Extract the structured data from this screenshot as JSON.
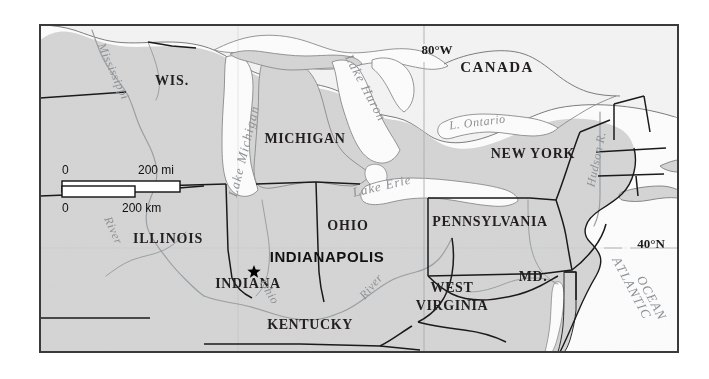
{
  "map": {
    "title": "Reference map of the Great Lakes region showing Indianapolis, Indiana",
    "frame": {
      "x": 40,
      "y": 25,
      "width": 638,
      "height": 327
    },
    "colors": {
      "land_us": "#d4d4d4",
      "land_canada": "#f2f2f2",
      "water": "#fbfbfb",
      "frame_border": "#3a3a3a",
      "state_border": "#1a1a1a",
      "river": "#9aa0a4",
      "water_label": "#8d9094",
      "page_background": "#ffffff",
      "marker": "#000000"
    },
    "labels": {
      "countries": [
        {
          "name": "CANADA",
          "text": "CANADA",
          "x": 497,
          "y": 72,
          "size": 15,
          "spacing": 1.4
        }
      ],
      "states": [
        {
          "name": "wisconsin",
          "text": "WIS.",
          "x": 172,
          "y": 85,
          "size": 14,
          "spacing": 0.8
        },
        {
          "name": "michigan",
          "text": "MICHIGAN",
          "x": 305,
          "y": 143,
          "size": 14,
          "spacing": 0.6
        },
        {
          "name": "new-york",
          "text": "NEW YORK",
          "x": 533,
          "y": 158,
          "size": 14,
          "spacing": 0.8
        },
        {
          "name": "illinois",
          "text": "ILLINOIS",
          "x": 168,
          "y": 243,
          "size": 14,
          "spacing": 0.8
        },
        {
          "name": "ohio",
          "text": "OHIO",
          "x": 348,
          "y": 230,
          "size": 14,
          "spacing": 0.8
        },
        {
          "name": "pennsylvania",
          "text": "PENNSYLVANIA",
          "x": 490,
          "y": 226,
          "size": 14,
          "spacing": 0.6
        },
        {
          "name": "indiana",
          "text": "INDIANA",
          "x": 248,
          "y": 288,
          "size": 14,
          "spacing": 0.6
        },
        {
          "name": "kentucky",
          "text": "KENTUCKY",
          "x": 310,
          "y": 329,
          "size": 14,
          "spacing": 0.6
        },
        {
          "name": "west-virginia-1",
          "text": "WEST",
          "x": 452,
          "y": 292,
          "size": 14,
          "spacing": 0.6
        },
        {
          "name": "west-virginia-2",
          "text": "VIRGINIA",
          "x": 452,
          "y": 310,
          "size": 14,
          "spacing": 0.6
        },
        {
          "name": "maryland",
          "text": "MD.",
          "x": 533,
          "y": 281,
          "size": 14,
          "spacing": 0.6
        }
      ],
      "waters": [
        {
          "name": "lake-michigan",
          "text": "Lake Michigan",
          "x": 248,
          "y": 152,
          "size": 13,
          "rotate": -76,
          "spacing": 1.2
        },
        {
          "name": "lake-huron",
          "text": "Lake Huron",
          "x": 362,
          "y": 90,
          "size": 13,
          "rotate": 62,
          "spacing": 1.2
        },
        {
          "name": "lake-erie",
          "text": "Lake Erie",
          "x": 383,
          "y": 190,
          "size": 13,
          "rotate": -13,
          "spacing": 1.0
        },
        {
          "name": "lake-ontario",
          "text": "L. Ontario",
          "x": 478,
          "y": 126,
          "size": 12,
          "rotate": -7,
          "spacing": 0.6
        },
        {
          "name": "mississippi-river-1",
          "text": "Mississippi",
          "x": 110,
          "y": 73,
          "size": 12,
          "rotate": 66,
          "spacing": 0.6
        },
        {
          "name": "mississippi-river-2",
          "text": "River",
          "x": 110,
          "y": 232,
          "size": 12,
          "rotate": 66,
          "spacing": 0.6
        },
        {
          "name": "ohio-river-1",
          "text": "Ohio",
          "x": 266,
          "y": 294,
          "size": 12,
          "rotate": 58,
          "spacing": 0.6
        },
        {
          "name": "ohio-river-2",
          "text": "River",
          "x": 374,
          "y": 289,
          "size": 12,
          "rotate": -50,
          "spacing": 0.6
        },
        {
          "name": "hudson-river",
          "text": "Hudson R.",
          "x": 600,
          "y": 160,
          "size": 12,
          "rotate": -78,
          "spacing": 0.6
        },
        {
          "name": "atlantic-ocean-1",
          "text": "ATLANTIC",
          "x": 628,
          "y": 290,
          "size": 13,
          "rotate": 62,
          "spacing": 1.2
        },
        {
          "name": "atlantic-ocean-2",
          "text": "OCEAN",
          "x": 648,
          "y": 300,
          "size": 13,
          "rotate": 62,
          "spacing": 1.2
        }
      ],
      "cities": [
        {
          "name": "indianapolis",
          "text": "INDIANAPOLIS",
          "x": 327,
          "y": 262,
          "size": 15,
          "spacing": 0.6,
          "marker": {
            "x": 254,
            "y": 272,
            "r": 7
          }
        }
      ],
      "graticule": [
        {
          "name": "longitude-80w",
          "text": "80°W",
          "x": 437,
          "y": 54,
          "size": 13
        },
        {
          "name": "latitude-40n",
          "text": "40°N",
          "x": 651,
          "y": 248,
          "size": 13
        }
      ]
    },
    "scale_bar": {
      "name": "scale-bar",
      "miles": {
        "label_zero": "0",
        "label_max": "200 mi",
        "value": 200,
        "unit": "mi"
      },
      "km": {
        "label_zero": "0",
        "label_max": "200 km",
        "value": 200,
        "unit": "km"
      },
      "geometry": {
        "x": 62,
        "y_mi_text": 174,
        "y_km_text": 212,
        "bar_x": 62,
        "bar_y": 181,
        "bar_mi_width": 118,
        "bar_km_width": 73,
        "bar_height": 11,
        "label_mi_x": 138,
        "label_km_x": 122
      },
      "text_size": 12
    }
  }
}
